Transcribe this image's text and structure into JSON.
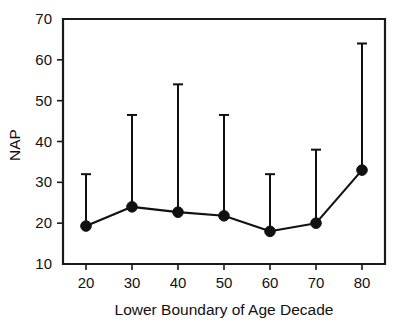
{
  "chart_data": {
    "type": "line",
    "title": "",
    "subtitle": "",
    "xlabel": "Lower Boundary of Age Decade",
    "ylabel": "NAP",
    "x": [
      20,
      30,
      40,
      50,
      60,
      70,
      80
    ],
    "values": [
      19.3,
      24.0,
      22.7,
      21.8,
      18.0,
      20.0,
      33.0
    ],
    "error_upper": [
      32.0,
      46.5,
      54.0,
      46.5,
      32.0,
      38.0,
      64.0
    ],
    "series": [
      {
        "name": "NAP",
        "values": [
          19.3,
          24.0,
          22.7,
          21.8,
          18.0,
          20.0,
          33.0
        ],
        "error_upper": [
          32.0,
          46.5,
          54.0,
          46.5,
          32.0,
          38.0,
          64.0
        ]
      }
    ],
    "xlim": [
      15,
      85
    ],
    "ylim": [
      10,
      70
    ],
    "xticks": [
      20,
      30,
      40,
      50,
      60,
      70,
      80
    ],
    "yticks": [
      10,
      20,
      30,
      40,
      50,
      60,
      70
    ],
    "xtick_labels": [
      "20",
      "30",
      "40",
      "50",
      "60",
      "70",
      "80"
    ],
    "ytick_labels": [
      "10",
      "20",
      "30",
      "40",
      "50",
      "60",
      "70"
    ],
    "grid": false,
    "legend": null,
    "marker": "filled-circle",
    "error_bar_style": "upper-only-with-cap",
    "line_color": "#111111",
    "marker_color": "#111111",
    "background_color": "#ffffff",
    "annotations": []
  },
  "axis": {
    "y_title": "NAP",
    "x_title": "Lower Boundary of Age Decade"
  }
}
